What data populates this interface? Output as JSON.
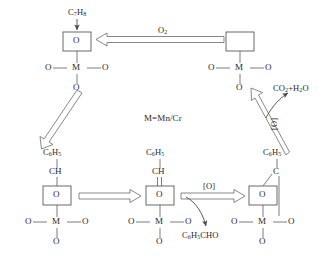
{
  "diagram": {
    "center_note": "M=Mn/Cr",
    "reactant_top": "C7H8",
    "oxidant": "O2",
    "products_deep": "CO2+H2O",
    "product_partial": "C6H5CHO",
    "oxidant_species": "[O]",
    "metal_symbol": "M",
    "oxygen_symbol": "O",
    "vacancy_label": "",
    "nodes": [
      {
        "id": "top-left",
        "name": "oxidized-catalyst-site",
        "box_content": "O",
        "top_group": "",
        "ligands": [
          "O",
          "O",
          "O"
        ]
      },
      {
        "id": "top-right",
        "name": "reduced-catalyst-vacancy",
        "box_content": "",
        "top_group": "",
        "ligands": [
          "O",
          "O",
          "O"
        ]
      },
      {
        "id": "bottom-left",
        "name": "benzyl-alkoxide-intermediate",
        "box_content": "O",
        "top_group": "C6H5",
        "linker": "CH",
        "ligands": [
          "O",
          "O",
          "O"
        ]
      },
      {
        "id": "bottom-center",
        "name": "benzylidene-intermediate",
        "box_content": "O",
        "top_group": "C6H5",
        "linker": "CH",
        "ligands": [
          "O",
          "O",
          "O"
        ]
      },
      {
        "id": "bottom-right",
        "name": "benzoate-intermediate",
        "box_content": "O",
        "top_group": "C6H5",
        "linker": "C",
        "ligands": [
          "O",
          "O",
          "O"
        ]
      }
    ],
    "arrows": [
      {
        "name": "arrow-toluene-adsorption",
        "label": "C7H8",
        "style": "solid-thin"
      },
      {
        "name": "arrow-reoxidation-o2",
        "label": "O2",
        "style": "hollow-left"
      },
      {
        "name": "arrow-topleft-to-bottomleft",
        "label": "",
        "style": "hollow-downleft"
      },
      {
        "name": "arrow-bottomleft-to-bottomcenter",
        "label": "",
        "style": "hollow-right"
      },
      {
        "name": "arrow-bottomcenter-to-bottomright",
        "label": "[O]",
        "style": "hollow-right"
      },
      {
        "name": "arrow-benzaldehyde-desorption",
        "label": "C6H5CHO",
        "style": "curved-thin"
      },
      {
        "name": "arrow-bottomright-to-topright",
        "label": "[O]",
        "style": "hollow-upleft"
      },
      {
        "name": "arrow-deep-oxidation",
        "label": "CO2+H2O",
        "style": "curved-thin"
      }
    ],
    "colors": {
      "stroke": "#4a4a4a",
      "text": "#2a2a2a",
      "background": "#ffffff"
    }
  }
}
